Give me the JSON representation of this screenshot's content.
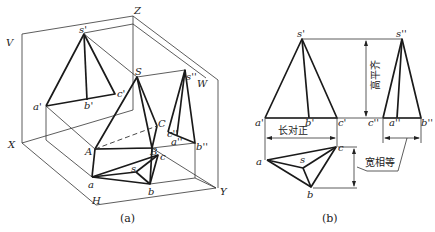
{
  "figure_a": {
    "caption": "(a)",
    "planes": {
      "V": "V",
      "W": "W",
      "H": "H"
    },
    "axes": {
      "X": "X",
      "Y": "Y",
      "Z": "Z"
    },
    "points_space": {
      "S": "S",
      "A": "A",
      "B": "B",
      "C": "C"
    },
    "points_V": {
      "s": "s'",
      "a": "a'",
      "b": "b'",
      "c": "c'"
    },
    "points_W": {
      "s": "s''",
      "a": "a''",
      "b": "b''",
      "c": "c''"
    },
    "points_H": {
      "s": "s",
      "a": "a",
      "b": "b",
      "c": "c"
    }
  },
  "figure_b": {
    "caption": "(b)",
    "points_V": {
      "s": "s'",
      "a": "a'",
      "b": "b'",
      "c": "c'"
    },
    "points_W": {
      "s": "s''",
      "a": "a''",
      "b": "b''",
      "c": "c''"
    },
    "points_H": {
      "s": "s",
      "a": "a",
      "b": "b",
      "c": "c"
    },
    "rules": {
      "length_aligned": "长对正",
      "height_level": "高平齐",
      "width_equal": "宽相等"
    }
  }
}
